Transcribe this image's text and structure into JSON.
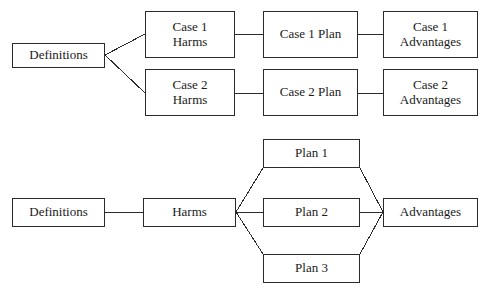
{
  "diagram": {
    "type": "flow-diagram",
    "title_visible": false,
    "background_color": "#ffffff",
    "line_color": "#2b2b2b",
    "text_color": "#1a1a1a",
    "panels": [
      {
        "id": "case-structure-top",
        "name": "two-case-parallel-structure",
        "nodes": [
          {
            "id": "top-definitions",
            "lines": [
              "Definitions"
            ],
            "x": 12,
            "y": 43,
            "w": 93,
            "h": 25
          },
          {
            "id": "case1-harms",
            "lines": [
              "Case 1",
              "Harms"
            ],
            "x": 145,
            "y": 11,
            "w": 90,
            "h": 47
          },
          {
            "id": "case2-harms",
            "lines": [
              "Case 2",
              "Harms"
            ],
            "x": 145,
            "y": 69,
            "w": 90,
            "h": 47
          },
          {
            "id": "case1-plan",
            "lines": [
              "Case 1 Plan"
            ],
            "x": 263,
            "y": 11,
            "w": 95,
            "h": 47
          },
          {
            "id": "case2-plan",
            "lines": [
              "Case 2 Plan"
            ],
            "x": 263,
            "y": 69,
            "w": 95,
            "h": 47
          },
          {
            "id": "case1-advantages",
            "lines": [
              "Case 1",
              "Advantages"
            ],
            "x": 383,
            "y": 11,
            "w": 95,
            "h": 47
          },
          {
            "id": "case2-advantages",
            "lines": [
              "Case 2",
              "Advantages"
            ],
            "x": 383,
            "y": 69,
            "w": 95,
            "h": 47
          }
        ],
        "edges": [
          {
            "from": "top-definitions",
            "to": "case1-harms",
            "points": [
              [
                105,
                55
              ],
              [
                145,
                34
              ]
            ]
          },
          {
            "from": "top-definitions",
            "to": "case2-harms",
            "points": [
              [
                105,
                55
              ],
              [
                145,
                93
              ]
            ]
          },
          {
            "from": "case1-harms",
            "to": "case1-plan",
            "points": [
              [
                235,
                34
              ],
              [
                263,
                34
              ]
            ]
          },
          {
            "from": "case2-harms",
            "to": "case2-plan",
            "points": [
              [
                235,
                93
              ],
              [
                263,
                93
              ]
            ]
          },
          {
            "from": "case1-plan",
            "to": "case1-advantages",
            "points": [
              [
                358,
                34
              ],
              [
                383,
                34
              ]
            ]
          },
          {
            "from": "case2-plan",
            "to": "case2-advantages",
            "points": [
              [
                358,
                93
              ],
              [
                383,
                93
              ]
            ]
          }
        ]
      },
      {
        "id": "case-structure-bottom",
        "name": "single-case-multi-plan-structure",
        "nodes": [
          {
            "id": "bottom-definitions",
            "lines": [
              "Definitions"
            ],
            "x": 12,
            "y": 198,
            "w": 93,
            "h": 29
          },
          {
            "id": "bottom-harms",
            "lines": [
              "Harms"
            ],
            "x": 143,
            "y": 198,
            "w": 93,
            "h": 29
          },
          {
            "id": "plan-1",
            "lines": [
              "Plan 1"
            ],
            "x": 263,
            "y": 139,
            "w": 97,
            "h": 29
          },
          {
            "id": "plan-2",
            "lines": [
              "Plan 2"
            ],
            "x": 263,
            "y": 198,
            "w": 97,
            "h": 29
          },
          {
            "id": "plan-3",
            "lines": [
              "Plan 3"
            ],
            "x": 263,
            "y": 254,
            "w": 97,
            "h": 29
          },
          {
            "id": "bottom-advantages",
            "lines": [
              "Advantages"
            ],
            "x": 383,
            "y": 198,
            "w": 95,
            "h": 29
          }
        ],
        "edges": [
          {
            "from": "bottom-definitions",
            "to": "bottom-harms",
            "points": [
              [
                105,
                212
              ],
              [
                143,
                212
              ]
            ]
          },
          {
            "from": "bottom-harms",
            "to": "plan-1",
            "points": [
              [
                236,
                212
              ],
              [
                263,
                168
              ]
            ]
          },
          {
            "from": "bottom-harms",
            "to": "plan-2",
            "points": [
              [
                236,
                212
              ],
              [
                263,
                212
              ]
            ]
          },
          {
            "from": "bottom-harms",
            "to": "plan-3",
            "points": [
              [
                236,
                212
              ],
              [
                263,
                254
              ]
            ]
          },
          {
            "from": "plan-1",
            "to": "bottom-advantages",
            "points": [
              [
                360,
                168
              ],
              [
                383,
                212
              ]
            ]
          },
          {
            "from": "plan-2",
            "to": "bottom-advantages",
            "points": [
              [
                360,
                212
              ],
              [
                383,
                212
              ]
            ]
          },
          {
            "from": "plan-3",
            "to": "bottom-advantages",
            "points": [
              [
                360,
                254
              ],
              [
                383,
                212
              ]
            ]
          }
        ]
      }
    ]
  }
}
